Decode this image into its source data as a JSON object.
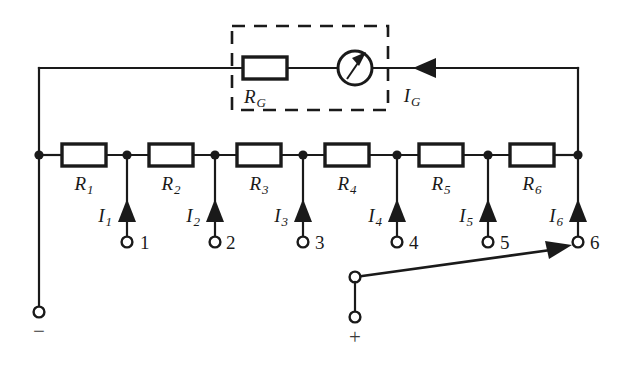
{
  "figure": {
    "kind": "circuit-schematic",
    "colors": {
      "ink": "#1a1a1a",
      "background": "#ffffff",
      "label_gray": "#3a3a3a"
    }
  },
  "galvanometer_branch": {
    "enclosure": "dashed-box",
    "resistor_label": "R",
    "resistor_sub": "G",
    "meter_icon": "galvanometer-icon",
    "current_label": "I",
    "current_sub": "G",
    "current_direction": "left"
  },
  "resistors": [
    {
      "label": "R",
      "sub": "1"
    },
    {
      "label": "R",
      "sub": "2"
    },
    {
      "label": "R",
      "sub": "3"
    },
    {
      "label": "R",
      "sub": "4"
    },
    {
      "label": "R",
      "sub": "5"
    },
    {
      "label": "R",
      "sub": "6"
    }
  ],
  "taps": [
    {
      "current_label": "I",
      "current_sub": "1",
      "terminal_number": "1"
    },
    {
      "current_label": "I",
      "current_sub": "2",
      "terminal_number": "2"
    },
    {
      "current_label": "I",
      "current_sub": "3",
      "terminal_number": "3"
    },
    {
      "current_label": "I",
      "current_sub": "4",
      "terminal_number": "4"
    },
    {
      "current_label": "I",
      "current_sub": "5",
      "terminal_number": "5"
    },
    {
      "current_label": "I",
      "current_sub": "6",
      "terminal_number": "6"
    }
  ],
  "supply": {
    "negative_sign": "−",
    "positive_sign": "+",
    "switch": "selector-switch",
    "switch_position": "6"
  }
}
